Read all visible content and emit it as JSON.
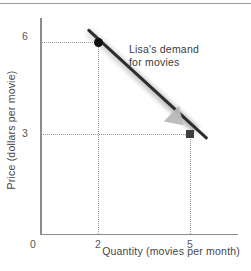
{
  "chart_data": {
    "type": "line",
    "title": "",
    "xlabel": "Quantity (movies per month)",
    "ylabel": "Price (dollars per movie)",
    "xlim": [
      0,
      6.5
    ],
    "ylim": [
      0,
      7.5
    ],
    "grid": "dotted-guides-only",
    "legend": "none",
    "x_ticks": [
      "0",
      "2",
      "5"
    ],
    "x_tick_values": [
      0,
      2,
      5
    ],
    "y_ticks": [
      "6",
      "3"
    ],
    "y_tick_values": [
      6,
      3
    ],
    "series": [
      {
        "name": "Lisa's demand for movies",
        "type": "line",
        "x": [
          2,
          5
        ],
        "y": [
          6,
          3
        ],
        "points": [
          {
            "x": 2,
            "y": 6,
            "marker": "circle",
            "color": "#111111"
          },
          {
            "x": 5,
            "y": 3,
            "marker": "square",
            "color": "#3f3f3f"
          }
        ],
        "color": "#2d2d2d"
      }
    ],
    "annotations": [
      {
        "text_line_1": "Lisa's demand",
        "text_line_2": "for movies",
        "x": 3.2,
        "y": 6.1
      }
    ],
    "guides": [
      {
        "orientation": "horizontal",
        "value": 6
      },
      {
        "orientation": "horizontal",
        "value": 3
      },
      {
        "orientation": "vertical",
        "value": 2
      },
      {
        "orientation": "vertical",
        "value": 5
      }
    ]
  },
  "axes": {
    "y_title": "Price (dollars per movie)",
    "x_title": "Quantity (movies per month)",
    "ticks": {
      "y_6": "6",
      "y_3": "3",
      "x_0": "0",
      "x_2": "2",
      "x_5": "5"
    }
  },
  "annotation": {
    "line1": "Lisa's demand",
    "line2": "for movies"
  },
  "colors": {
    "curve": "#2d2d2d",
    "point_high": "#111111",
    "point_low": "#3f3f3f",
    "arrow": "#b9b9b9",
    "axis": "#8c8c8c",
    "guide": "#9b9b9b",
    "text": "#3a3a3a",
    "top_rule": "#9a9a9a",
    "background": "#ffffff"
  }
}
